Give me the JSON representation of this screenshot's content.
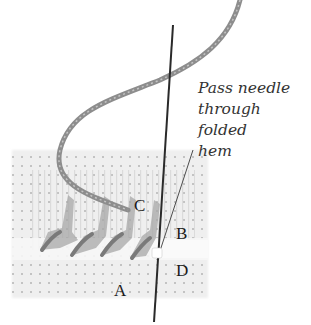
{
  "caption": {
    "line1": "Pass needle",
    "line2": "through folded",
    "line3": "hem"
  },
  "labels": {
    "a": "A",
    "b": "B",
    "c": "C",
    "d": "D"
  },
  "colors": {
    "fabric": "#e9e9e9",
    "fabric_dots": "#bdbdbd",
    "thread": "#8d8d8d",
    "needle": "#2a2a2a",
    "text": "#333333"
  }
}
